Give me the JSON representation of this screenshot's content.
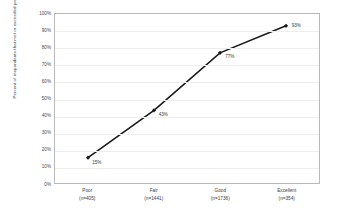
{
  "chart_data": {
    "type": "line",
    "title": "",
    "xlabel": "",
    "ylabel": "Percent of respondents that met or exceeded project objectives",
    "categories": [
      "Poor",
      "Fair",
      "Good",
      "Excellent"
    ],
    "category_counts": [
      "(n=405)",
      "(n=1441)",
      "(n=1736)",
      "(n=354)"
    ],
    "values": [
      15,
      43,
      77,
      93
    ],
    "value_labels": [
      "15%",
      "43%",
      "77%",
      "93%"
    ],
    "ylim": [
      0,
      100
    ],
    "y_ticks": [
      0,
      10,
      20,
      30,
      40,
      50,
      60,
      70,
      80,
      90,
      100
    ],
    "y_tick_labels": [
      "0%",
      "10%",
      "20%",
      "30%",
      "40%",
      "50%",
      "60%",
      "70%",
      "80%",
      "90%",
      "100%"
    ],
    "grid": true,
    "legend": false,
    "legend_position": "none",
    "series_color": "#1a1a1a",
    "marker": "diamond",
    "gridline_color": "#ededed",
    "plot_border_color": "#b9b9b9",
    "background_color": "#ffffff"
  }
}
